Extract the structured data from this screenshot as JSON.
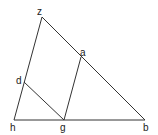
{
  "diagram": {
    "points": {
      "z": {
        "label": "z",
        "x": 42,
        "y": 17
      },
      "a": {
        "label": "a",
        "x": 81,
        "y": 57
      },
      "d": {
        "label": "d",
        "x": 24,
        "y": 82
      },
      "h": {
        "label": "h",
        "x": 14,
        "y": 120
      },
      "g": {
        "label": "g",
        "x": 64,
        "y": 120
      },
      "b": {
        "label": "b",
        "x": 145,
        "y": 120
      }
    },
    "segments": [
      [
        "z",
        "b"
      ],
      [
        "z",
        "h"
      ],
      [
        "h",
        "b"
      ],
      [
        "d",
        "g"
      ],
      [
        "a",
        "g"
      ]
    ],
    "colors": {
      "line": "#333333",
      "text": "#222222",
      "background": "#ffffff"
    }
  }
}
